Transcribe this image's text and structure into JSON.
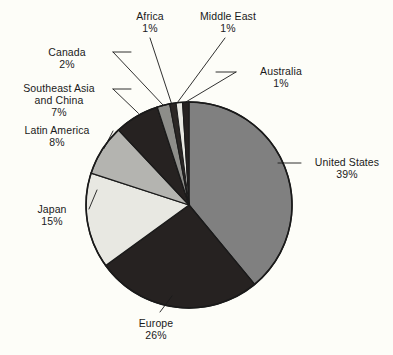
{
  "chart_data": {
    "type": "pie",
    "title": "",
    "subtitle": "",
    "xlabel": "",
    "ylabel": "",
    "legend_position": "none",
    "grid": false,
    "units": "percent",
    "total": 100,
    "start_angle_deg": 0,
    "direction": "clockwise",
    "categories": [
      "United States",
      "Europe",
      "Japan",
      "Latin America",
      "Southeast Asia and China",
      "Canada",
      "Africa",
      "Middle East",
      "Australia"
    ],
    "values": [
      39,
      26,
      15,
      8,
      7,
      2,
      1,
      1,
      1
    ],
    "slices": [
      {
        "label": "United States",
        "label_line1": "United States",
        "label_line2": "",
        "value": 39,
        "percent_text": "39%",
        "color": "#808080"
      },
      {
        "label": "Europe",
        "label_line1": "Europe",
        "label_line2": "",
        "value": 26,
        "percent_text": "26%",
        "color": "#262221"
      },
      {
        "label": "Japan",
        "label_line1": "Japan",
        "label_line2": "",
        "value": 15,
        "percent_text": "15%",
        "color": "#e8e8e2"
      },
      {
        "label": "Latin America",
        "label_line1": "Latin America",
        "label_line2": "",
        "value": 8,
        "percent_text": "8%",
        "color": "#b4b4b0"
      },
      {
        "label": "Southeast Asia and China",
        "label_line1": "Southeast Asia",
        "label_line2": "and China",
        "value": 7,
        "percent_text": "7%",
        "color": "#262221"
      },
      {
        "label": "Canada",
        "label_line1": "Canada",
        "label_line2": "",
        "value": 2,
        "percent_text": "2%",
        "color": "#8d8d89"
      },
      {
        "label": "Africa",
        "label_line1": "Africa",
        "label_line2": "",
        "value": 1,
        "percent_text": "1%",
        "color": "#2b2725"
      },
      {
        "label": "Middle East",
        "label_line1": "Middle East",
        "label_line2": "",
        "value": 1,
        "percent_text": "1%",
        "color": "#e8e8e2"
      },
      {
        "label": "Australia",
        "label_line1": "Australia",
        "label_line2": "",
        "value": 1,
        "percent_text": "1%",
        "color": "#262221"
      }
    ],
    "colors": {
      "background": "#fdfdf8",
      "outline": "#1a1a1a",
      "text": "#1a1a1a",
      "leader_line": "#1a1a1a"
    }
  }
}
